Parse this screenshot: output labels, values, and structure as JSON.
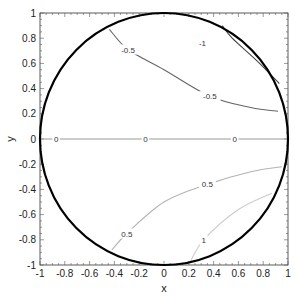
{
  "chart_data": {
    "type": "contour",
    "title": "",
    "xlabel": "x",
    "ylabel": "y",
    "xlim": [
      -1,
      1
    ],
    "ylim": [
      -1,
      1
    ],
    "grid": false,
    "legend": null,
    "x_ticks": [
      "-1",
      "-0.8",
      "-0.6",
      "-0.4",
      "-0.2",
      "0",
      "0.2",
      "0.4",
      "0.6",
      "0.8",
      "1"
    ],
    "y_ticks": [
      "-1",
      "-0.8",
      "-0.6",
      "-0.4",
      "-0.2",
      "0",
      "0.2",
      "0.4",
      "0.6",
      "0.8",
      "1"
    ],
    "boundary": {
      "shape": "unit circle",
      "center": [
        0,
        0
      ],
      "radius": 1
    },
    "contours": [
      {
        "level": -1,
        "label": "-1",
        "color": "#444444",
        "points": [
          [
            0.47,
            0.9
          ],
          [
            0.55,
            0.8
          ],
          [
            0.75,
            0.62
          ],
          [
            0.93,
            0.44
          ]
        ]
      },
      {
        "level": -0.5,
        "label": "-0.5",
        "color": "#666666",
        "points": [
          [
            -0.44,
            0.87
          ],
          [
            -0.29,
            0.71
          ],
          [
            0.0,
            0.55
          ],
          [
            0.37,
            0.34
          ],
          [
            0.7,
            0.25
          ],
          [
            0.92,
            0.22
          ]
        ]
      },
      {
        "level": 0,
        "label": "0",
        "color": "#999999",
        "points": [
          [
            -1,
            0
          ],
          [
            1,
            0
          ]
        ]
      },
      {
        "level": 0.5,
        "label": "0.5",
        "color": "#b3b3b3",
        "points": [
          [
            -0.42,
            -0.88
          ],
          [
            -0.3,
            -0.75
          ],
          [
            0.0,
            -0.5
          ],
          [
            0.35,
            -0.36
          ],
          [
            0.7,
            -0.26
          ],
          [
            0.95,
            -0.22
          ]
        ]
      },
      {
        "level": 1,
        "label": "1",
        "color": "#cccccc",
        "points": [
          [
            0.21,
            -0.98
          ],
          [
            0.32,
            -0.8
          ],
          [
            0.6,
            -0.56
          ],
          [
            0.87,
            -0.43
          ]
        ]
      }
    ],
    "contour_labels": [
      {
        "text": "-1",
        "x": 0.31,
        "y": 0.76
      },
      {
        "text": "-0.5",
        "x": -0.29,
        "y": 0.71
      },
      {
        "text": "-0.5",
        "x": 0.37,
        "y": 0.34
      },
      {
        "text": "0",
        "x": -0.87,
        "y": 0
      },
      {
        "text": "0",
        "x": -0.15,
        "y": 0
      },
      {
        "text": "0",
        "x": 0.57,
        "y": 0
      },
      {
        "text": "0.5",
        "x": -0.3,
        "y": -0.75
      },
      {
        "text": "0.5",
        "x": 0.35,
        "y": -0.36
      },
      {
        "text": "1",
        "x": 0.32,
        "y": -0.8
      }
    ]
  }
}
